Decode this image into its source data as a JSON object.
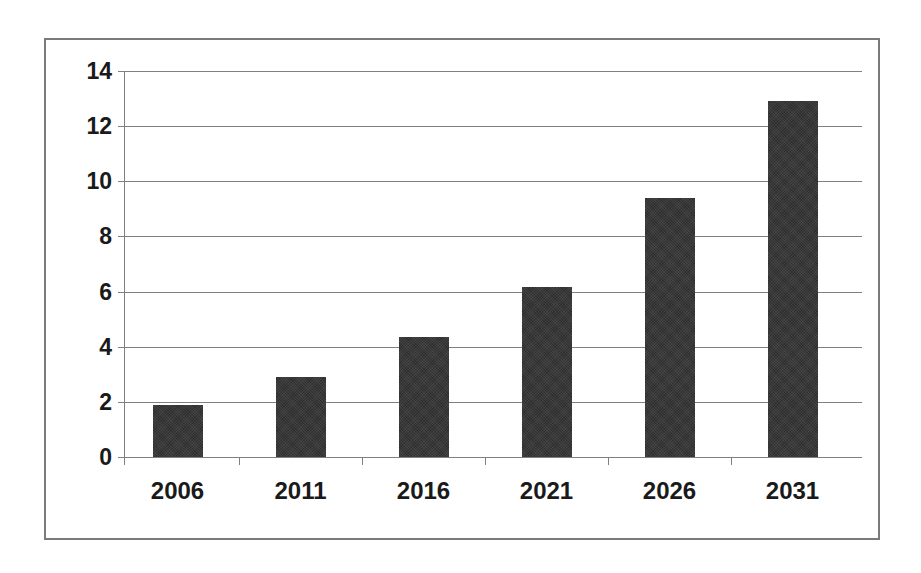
{
  "chart_data": {
    "type": "bar",
    "title": "",
    "subtitle": "",
    "xlabel": "",
    "ylabel": "",
    "categories": [
      "2006",
      "2011",
      "2016",
      "2021",
      "2026",
      "2031"
    ],
    "values": [
      1.9,
      2.9,
      4.35,
      6.15,
      9.4,
      12.9
    ],
    "series": [
      {
        "name": "",
        "values": [
          1.9,
          2.9,
          4.35,
          6.15,
          9.4,
          12.9
        ]
      }
    ],
    "ylim": [
      0,
      14
    ],
    "ytick_labels": [
      "0",
      "2",
      "4",
      "6",
      "8",
      "10",
      "12",
      "14"
    ],
    "ytick_values": [
      0,
      2,
      4,
      6,
      8,
      10,
      12,
      14
    ],
    "grid": true,
    "grid_axis": "y",
    "legend": false,
    "legend_position": "none",
    "bar_color": "#2e2e2e",
    "gridline_color": "#808080",
    "axis_color": "#808080",
    "frame_color": "#7a7a7a",
    "background_color": "#ffffff",
    "text_color": "#1a1a1a",
    "annotations": []
  }
}
